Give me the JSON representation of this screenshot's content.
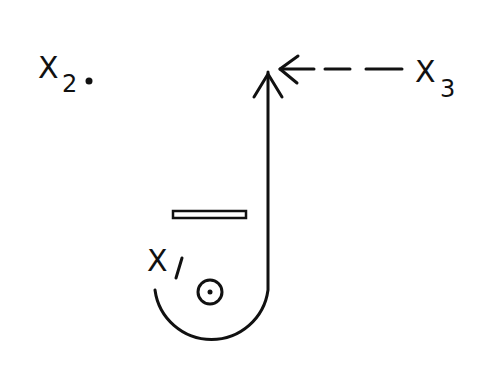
{
  "diagram": {
    "type": "hand-drawn schematic",
    "labels": {
      "x1": {
        "base": "X",
        "subscript": "1"
      },
      "x2": {
        "base": "X",
        "subscript": "2",
        "marker": "dot"
      },
      "x3": {
        "base": "X",
        "subscript": "3"
      }
    },
    "elements": [
      "J-shaped curve with upward arrow",
      "dashed arrow from X3 pointing left to arrow tip",
      "horizontal double-line bar",
      "small circle with center dot"
    ],
    "colors": {
      "ink": "#111111",
      "background": "#ffffff"
    }
  }
}
